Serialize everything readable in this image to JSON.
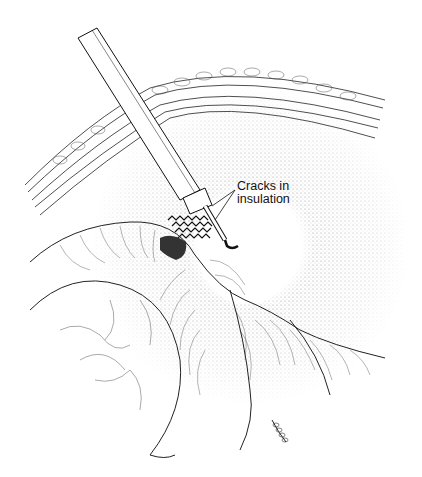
{
  "figure": {
    "annotation": {
      "line1": "Cracks in",
      "line2": "insulation"
    },
    "colors": {
      "ink": "#111111",
      "background": "#ffffff",
      "stipple": "#666666"
    }
  }
}
